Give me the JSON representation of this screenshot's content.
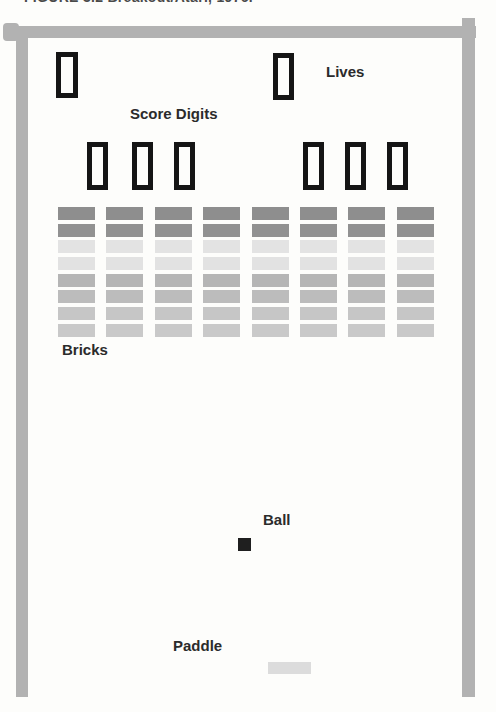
{
  "caption": "FIGURE 3.2 Breakout/Atari, 1976.",
  "annotations": {
    "score_digits": "Score Digits",
    "lives": "Lives",
    "bricks": "Bricks",
    "ball": "Ball",
    "paddle": "Paddle"
  },
  "colors": {
    "frame": "#b2b2b2",
    "digit_box_border": "#151515",
    "ball": "#1f1f1f",
    "paddle": "#dcdcdc",
    "label_text": "#2b2b2b"
  },
  "bricks": {
    "rows": 8,
    "cols": 8,
    "row_colors": [
      "#8e8e8e",
      "#919191",
      "#e3e3e3",
      "#e2e2e2",
      "#b5b5b5",
      "#bcbcbc",
      "#c6c6c6",
      "#c9c9c9"
    ]
  }
}
